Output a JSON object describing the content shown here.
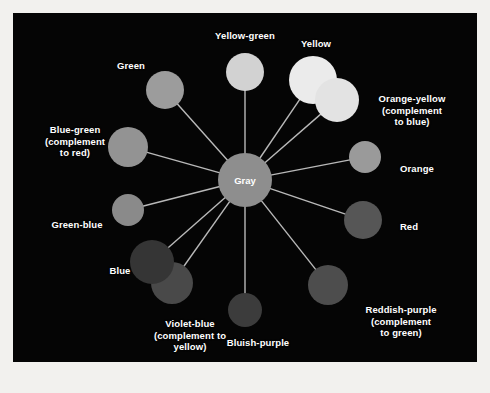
{
  "figure": {
    "background_color": "#f2f1ee",
    "panel_color": "#050505",
    "panel": {
      "x": 13,
      "y": 13,
      "width": 464,
      "height": 349
    },
    "spoke_color": "#b9b9b9",
    "label_color": "#ffffff"
  },
  "hub": {
    "label": "Gray",
    "cx": 232,
    "cy": 167,
    "r": 27,
    "color": "#8e8e8e"
  },
  "nodes": [
    {
      "id": "yellow-green",
      "label": "Yellow-green",
      "label_lines": [
        "Yellow-green"
      ],
      "cx": 232,
      "cy": 59,
      "r": 19,
      "color": "#d2d2d2",
      "label_x": 232,
      "label_y": 23,
      "angle_deg": 270
    },
    {
      "id": "yellow",
      "label": "Yellow",
      "label_lines": [
        "Yellow"
      ],
      "cx": 300,
      "cy": 67,
      "r": 24,
      "color": "#ebebeb",
      "label_x": 303,
      "label_y": 31,
      "angle_deg": 300
    },
    {
      "id": "orange-yellow",
      "label": "Orange-yellow (complement to blue)",
      "label_lines": [
        "Orange-yellow",
        "(complement",
        "to blue)"
      ],
      "cx": 324,
      "cy": 87,
      "r": 22,
      "color": "#e3e3e3",
      "label_x": 399,
      "label_y": 97,
      "angle_deg": 318
    },
    {
      "id": "orange",
      "label": "Orange",
      "label_lines": [
        "Orange"
      ],
      "cx": 352,
      "cy": 144,
      "r": 16,
      "color": "#9a9a9a",
      "label_x": 404,
      "label_y": 156,
      "angle_deg": 335
    },
    {
      "id": "red",
      "label": "Red",
      "label_lines": [
        "Red"
      ],
      "cx": 350,
      "cy": 207,
      "r": 19,
      "color": "#565656",
      "label_x": 396,
      "label_y": 214,
      "angle_deg": 20
    },
    {
      "id": "reddish-purple",
      "label": "Reddish-purple (complement to green)",
      "label_lines": [
        "Reddish-purple",
        "(complement",
        "to green)"
      ],
      "cx": 315,
      "cy": 272,
      "r": 20,
      "color": "#4d4d4d",
      "label_x": 388,
      "label_y": 308,
      "angle_deg": 52
    },
    {
      "id": "bluish-purple",
      "label": "Bluish-purple",
      "label_lines": [
        "Bluish-purple"
      ],
      "cx": 232,
      "cy": 297,
      "r": 17,
      "color": "#3c3c3c",
      "label_x": 245,
      "label_y": 330,
      "angle_deg": 90
    },
    {
      "id": "violet-blue",
      "label": "Violet-blue (complement to yellow)",
      "label_lines": [
        "Violet-blue",
        "(complement to",
        "yellow)"
      ],
      "cx": 159,
      "cy": 270,
      "r": 21,
      "color": "#494949",
      "label_x": 177,
      "label_y": 322,
      "angle_deg": 122
    },
    {
      "id": "blue",
      "label": "Blue",
      "label_lines": [
        "Blue"
      ],
      "cx": 139,
      "cy": 249,
      "r": 22,
      "color": "#353535",
      "label_x": 107,
      "label_y": 258,
      "angle_deg": 140
    },
    {
      "id": "green-blue",
      "label": "Green-blue",
      "label_lines": [
        "Green-blue"
      ],
      "cx": 115,
      "cy": 197,
      "r": 16,
      "color": "#8a8a8a",
      "label_x": 64,
      "label_y": 212,
      "angle_deg": 160
    },
    {
      "id": "blue-green",
      "label": "Blue-green (complement to red)",
      "label_lines": [
        "Blue-green",
        "(complement",
        "to red)"
      ],
      "cx": 115,
      "cy": 134,
      "r": 20,
      "color": "#939393",
      "label_x": 62,
      "label_y": 128,
      "angle_deg": 198
    },
    {
      "id": "green",
      "label": "Green",
      "label_lines": [
        "Green"
      ],
      "cx": 152,
      "cy": 77,
      "r": 19,
      "color": "#9c9c9c",
      "label_x": 118,
      "label_y": 53,
      "angle_deg": 232
    }
  ]
}
